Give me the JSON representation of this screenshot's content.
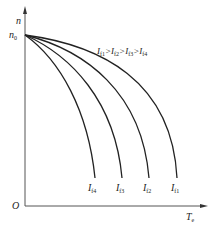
{
  "diagram": {
    "title": "",
    "axes": {
      "y_label": "n",
      "x_label_main": "T",
      "x_label_sub": "e",
      "origin_label": "O",
      "y_tick_label_main": "n",
      "y_tick_label_sub": "0"
    },
    "relation": {
      "parts": [
        {
          "main": "I",
          "sub": "f1"
        },
        {
          "main": "I",
          "sub": "f2"
        },
        {
          "main": "I",
          "sub": "f3"
        },
        {
          "main": "I",
          "sub": "f4"
        }
      ],
      "separator": ">"
    },
    "curves": [
      {
        "label_main": "I",
        "label_sub": "f4",
        "end_x": 95
      },
      {
        "label_main": "I",
        "label_sub": "f3",
        "end_x": 122
      },
      {
        "label_main": "I",
        "label_sub": "f2",
        "end_x": 149
      },
      {
        "label_main": "I",
        "label_sub": "f1",
        "end_x": 177
      }
    ],
    "colors": {
      "line": "#222222",
      "axis": "#555555"
    }
  }
}
